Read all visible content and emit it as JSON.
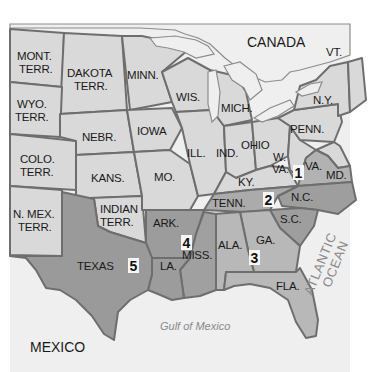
{
  "map": {
    "colors": {
      "background": "#ffffff",
      "water": "#efefef",
      "land_outside": "#ececec",
      "union_state": "#d9d9d9",
      "district_light": "#b9b9b9",
      "district_dark": "#9e9e9e",
      "border": "#6e6e6e"
    },
    "regions": {
      "canada": "CANADA",
      "mexico": "MEXICO",
      "atlantic_line1": "ATLANTIC",
      "atlantic_line2": "OCEAN",
      "gulf": "Gulf of Mexico"
    },
    "territories": [
      {
        "id": "mont",
        "line1": "MONT.",
        "line2": "TERR."
      },
      {
        "id": "dakota",
        "line1": "DAKOTA",
        "line2": "TERR."
      },
      {
        "id": "wyo",
        "line1": "WYO.",
        "line2": "TERR."
      },
      {
        "id": "colo",
        "line1": "COLO.",
        "line2": "TERR."
      },
      {
        "id": "nmex",
        "line1": "N. MEX.",
        "line2": "TERR."
      },
      {
        "id": "indian",
        "line1": "INDIAN",
        "line2": "TERR."
      }
    ],
    "states": {
      "minn": "MINN.",
      "wis": "WIS.",
      "mich": "MICH.",
      "iowa": "IOWA",
      "nebr": "NEBR.",
      "kans": "KANS.",
      "mo": "MO.",
      "ill": "ILL.",
      "ind": "IND.",
      "ohio": "OHIO",
      "ky": "KY.",
      "wva_line1": "W.",
      "wva_line2": "VA.",
      "va": "VA.",
      "md": "MD.",
      "penn": "PENN.",
      "ny": "N.Y.",
      "vt": "VT.",
      "tenn": "TENN.",
      "nc": "N.C.",
      "sc": "S.C.",
      "ga": "GA.",
      "ala": "ALA.",
      "miss": "MISS.",
      "ark": "ARK.",
      "la": "LA.",
      "texas": "TEXAS",
      "fla": "FLA."
    },
    "districts": [
      {
        "number": "1",
        "states": [
          "VA."
        ]
      },
      {
        "number": "2",
        "states": [
          "N.C.",
          "S.C."
        ]
      },
      {
        "number": "3",
        "states": [
          "GA.",
          "ALA.",
          "FLA."
        ]
      },
      {
        "number": "4",
        "states": [
          "MISS.",
          "ARK."
        ]
      },
      {
        "number": "5",
        "states": [
          "TEXAS",
          "LA."
        ]
      }
    ]
  }
}
